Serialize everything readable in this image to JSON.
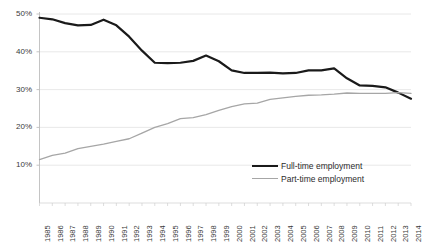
{
  "chart_data": {
    "type": "line",
    "title": "",
    "subtitle": "",
    "xlabel": "",
    "ylabel": "",
    "grid": true,
    "legend_position": "bottom-right",
    "ylim": [
      0,
      50
    ],
    "ytick_values": [
      10,
      20,
      30,
      40,
      50
    ],
    "ytick_labels": [
      "10%",
      "20%",
      "30%",
      "40%",
      "50%"
    ],
    "categories": [
      "1985",
      "1986",
      "1987",
      "1988",
      "1989",
      "1990",
      "1991",
      "1992",
      "1993",
      "1994",
      "1995",
      "1996",
      "1997",
      "1998",
      "1999",
      "2000",
      "2001",
      "2002",
      "2003",
      "2004",
      "2005",
      "2006",
      "2007",
      "2008",
      "2009",
      "2010",
      "2011",
      "2012",
      "2013",
      "2014"
    ],
    "series": [
      {
        "name": "Full-time employment",
        "color": "#1a1a1a",
        "width": 2.2,
        "values": [
          49.0,
          48.6,
          47.6,
          47.0,
          47.1,
          48.5,
          47.0,
          44.0,
          40.3,
          37.1,
          37.0,
          37.1,
          37.6,
          39.0,
          37.5,
          35.1,
          34.4,
          34.4,
          34.5,
          34.3,
          34.4,
          35.1,
          35.1,
          35.6,
          33.0,
          31.1,
          31.0,
          30.6,
          29.2,
          27.6
        ]
      },
      {
        "name": "Part-time employment",
        "color": "#a6a6a6",
        "width": 1.3,
        "values": [
          11.5,
          12.6,
          13.2,
          14.4,
          15.0,
          15.6,
          16.3,
          17.0,
          18.5,
          20.0,
          21.0,
          22.3,
          22.6,
          23.4,
          24.5,
          25.5,
          26.2,
          26.4,
          27.4,
          27.8,
          28.2,
          28.5,
          28.6,
          28.8,
          29.1,
          29.0,
          29.0,
          29.0,
          29.2,
          29.0
        ]
      }
    ]
  },
  "legend": {
    "items": [
      {
        "label": "Full-time employment"
      },
      {
        "label": "Part-time employment"
      }
    ]
  }
}
